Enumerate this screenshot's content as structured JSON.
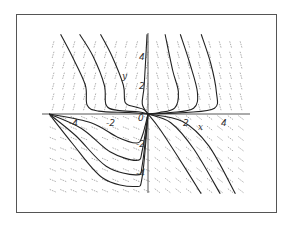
{
  "chart_data": {
    "type": "line",
    "subtype": "phase-portrait-direction-field",
    "title": "",
    "xlabel": "x",
    "ylabel": "y",
    "x_ticks": [
      -4,
      -2,
      0,
      2,
      4
    ],
    "y_ticks": [
      4,
      2,
      -2,
      -4
    ],
    "x_tick_labels": [
      "-4",
      "-2",
      "0",
      "2",
      "4"
    ],
    "y_tick_labels": [
      "4",
      "2",
      "-2",
      "-4"
    ],
    "xlim": [
      -5.2,
      5.2
    ],
    "ylim": [
      -5.5,
      5.6
    ],
    "grid": false,
    "legend": null,
    "direction_field": true,
    "trajectories": [
      {
        "region": "upper-left",
        "points": [
          [
            -4.6,
            5.5
          ],
          [
            -4.0,
            4.0
          ],
          [
            -3.3,
            2.0
          ],
          [
            -3.2,
            0.6
          ],
          [
            -2.6,
            0.2
          ],
          [
            -1.0,
            0.1
          ],
          [
            0,
            0
          ]
        ]
      },
      {
        "region": "upper-left",
        "points": [
          [
            -3.6,
            5.5
          ],
          [
            -2.9,
            4.0
          ],
          [
            -2.3,
            2.0
          ],
          [
            -2.2,
            0.6
          ],
          [
            -1.6,
            0.25
          ],
          [
            -0.5,
            0.15
          ],
          [
            0,
            0
          ]
        ]
      },
      {
        "region": "upper-left",
        "points": [
          [
            -2.5,
            5.5
          ],
          [
            -1.9,
            4.0
          ],
          [
            -1.3,
            2.0
          ],
          [
            -1.2,
            0.8
          ],
          [
            -0.7,
            0.5
          ],
          [
            -0.2,
            0.3
          ],
          [
            0,
            0
          ]
        ]
      },
      {
        "region": "upper-axis",
        "points": [
          [
            -0.05,
            5.5
          ],
          [
            -0.2,
            2.0
          ],
          [
            -0.3,
            0.7
          ],
          [
            0,
            0
          ]
        ]
      },
      {
        "region": "upper-right",
        "points": [
          [
            0.9,
            5.5
          ],
          [
            1.3,
            3.0
          ],
          [
            1.6,
            1.5
          ],
          [
            1.4,
            0.4
          ],
          [
            0.6,
            0.1
          ],
          [
            0,
            0
          ]
        ]
      },
      {
        "region": "upper-right",
        "points": [
          [
            1.7,
            5.5
          ],
          [
            2.2,
            3.5
          ],
          [
            2.6,
            1.5
          ],
          [
            2.4,
            0.4
          ],
          [
            1.2,
            0.1
          ],
          [
            0,
            0
          ]
        ]
      },
      {
        "region": "upper-right",
        "points": [
          [
            2.8,
            5.5
          ],
          [
            3.3,
            3.5
          ],
          [
            3.6,
            1.5
          ],
          [
            3.5,
            0.4
          ],
          [
            2.0,
            0.1
          ],
          [
            0,
            0
          ]
        ]
      },
      {
        "region": "lower-left",
        "points": [
          [
            -5.2,
            0
          ],
          [
            -3.0,
            -0.6
          ],
          [
            -1.6,
            -1.6
          ],
          [
            -0.6,
            -2.0
          ],
          [
            -0.3,
            -1.5
          ],
          [
            0,
            0
          ]
        ]
      },
      {
        "region": "lower-left",
        "points": [
          [
            -5.2,
            0
          ],
          [
            -3.5,
            -1.0
          ],
          [
            -2.0,
            -2.6
          ],
          [
            -0.6,
            -3.2
          ],
          [
            -0.3,
            -2.5
          ],
          [
            0,
            0
          ]
        ]
      },
      {
        "region": "lower-left",
        "points": [
          [
            -5.2,
            0
          ],
          [
            -3.8,
            -1.5
          ],
          [
            -2.2,
            -3.6
          ],
          [
            -0.6,
            -4.2
          ],
          [
            -0.3,
            -3.5
          ],
          [
            0,
            0
          ]
        ]
      },
      {
        "region": "lower-left",
        "points": [
          [
            -5.2,
            0
          ],
          [
            -4.0,
            -2.0
          ],
          [
            -2.4,
            -4.4
          ],
          [
            -0.7,
            -5.0
          ],
          [
            -0.3,
            -4.3
          ],
          [
            0,
            0
          ]
        ]
      },
      {
        "region": "lower-right",
        "points": [
          [
            0,
            0
          ],
          [
            0.6,
            -1.0
          ],
          [
            1.6,
            -3.0
          ],
          [
            2.8,
            -5.5
          ]
        ]
      },
      {
        "region": "lower-right",
        "points": [
          [
            0,
            0
          ],
          [
            1.2,
            -0.6
          ],
          [
            2.4,
            -2.4
          ],
          [
            3.8,
            -5.5
          ]
        ]
      },
      {
        "region": "lower-right",
        "points": [
          [
            0,
            0
          ],
          [
            1.8,
            -0.5
          ],
          [
            3.2,
            -2.2
          ],
          [
            4.6,
            -5.5
          ]
        ]
      }
    ]
  },
  "axes": {
    "x_label": "x",
    "y_label": "y",
    "x_ticks": [
      {
        "label": "-4",
        "value": -4
      },
      {
        "label": "-2",
        "value": -2
      },
      {
        "label": "0",
        "value": 0
      },
      {
        "label": "2",
        "value": 2
      },
      {
        "label": "4",
        "value": 4
      }
    ],
    "y_ticks": [
      {
        "label": "4",
        "value": 4
      },
      {
        "label": "2",
        "value": 2
      },
      {
        "label": "-2",
        "value": -2
      },
      {
        "label": "-4",
        "value": -4
      }
    ]
  },
  "colors": {
    "trajectory": "#222222",
    "field_arrow": "#9a9a9a",
    "axis": "#444444",
    "frame": "#555555",
    "background": "#ffffff"
  }
}
